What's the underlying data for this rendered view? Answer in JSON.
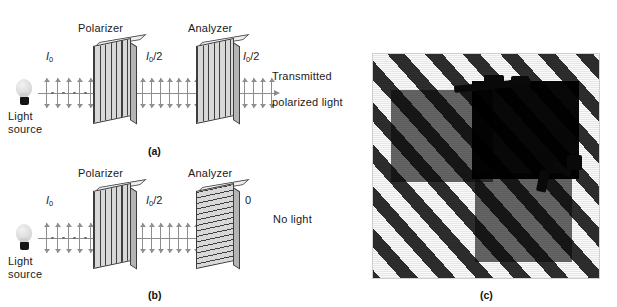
{
  "figure": {
    "caption_panels": [
      "(a)",
      "(b)",
      "(c)"
    ],
    "background_color": "#ffffff",
    "ink_color": "#1a1a1a"
  },
  "panel_a": {
    "tag": "(a)",
    "source_label_line1": "Light",
    "source_label_line2": "source",
    "polarizer_label": "Polarizer",
    "analyzer_label": "Analyzer",
    "incident_intensity": "I",
    "incident_subscript": "0",
    "after_polarizer_intensity": "I",
    "after_polarizer_subscript": "0",
    "after_polarizer_divisor": "/2",
    "after_analyzer_intensity": "I",
    "after_analyzer_subscript": "0",
    "after_analyzer_divisor": "/2",
    "output_label_line1": "Transmitted",
    "output_label_line2": "polarized light",
    "polarizer_axis": "vertical",
    "analyzer_axis": "vertical"
  },
  "panel_b": {
    "tag": "(b)",
    "source_label_line1": "Light",
    "source_label_line2": "source",
    "polarizer_label": "Polarizer",
    "analyzer_label": "Analyzer",
    "incident_intensity": "I",
    "incident_subscript": "0",
    "after_polarizer_intensity": "I",
    "after_polarizer_subscript": "0",
    "after_polarizer_divisor": "/2",
    "output_value": "0",
    "output_label": "No light",
    "polarizer_axis": "vertical",
    "analyzer_axis": "horizontal"
  },
  "panel_c": {
    "tag": "(c)",
    "subject": "polarized sunglasses over diagonal striped background",
    "lens_count": 3,
    "overlap_effect": "dark"
  }
}
